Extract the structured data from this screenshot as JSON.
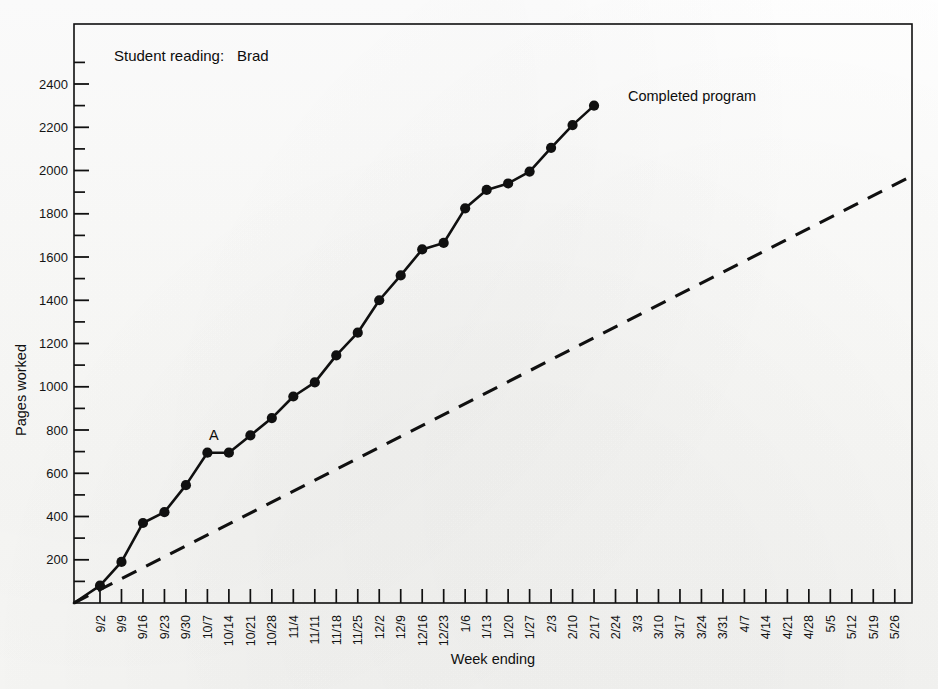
{
  "figure": {
    "background_color": "#fbfbfa",
    "ink_color": "#101010",
    "header_label": "Student reading:",
    "header_value": "Brad",
    "caption": ""
  },
  "annotations": {
    "point_a": "A",
    "completed_program": "Completed program"
  },
  "chart_data": {
    "type": "line",
    "xlabel": "Week ending",
    "ylabel": "Pages worked",
    "xlim": [
      0,
      39
    ],
    "ylim": [
      0,
      2500
    ],
    "ytick_step": 200,
    "yminor_step": 100,
    "grid": false,
    "legend": "none",
    "categories": [
      "9/2",
      "9/9",
      "9/16",
      "9/23",
      "9/30",
      "10/7",
      "10/14",
      "10/21",
      "10/28",
      "11/4",
      "11/11",
      "11/18",
      "11/25",
      "12/2",
      "12/9",
      "12/16",
      "12/23",
      "1/6",
      "1/13",
      "1/20",
      "1/27",
      "2/3",
      "2/10",
      "2/17",
      "2/24",
      "3/3",
      "3/10",
      "3/17",
      "3/24",
      "3/31",
      "4/7",
      "4/14",
      "4/21",
      "4/28",
      "5/5",
      "5/12",
      "5/19",
      "5/26"
    ],
    "ytick_labels": [
      "200",
      "400",
      "600",
      "800",
      "1000",
      "1200",
      "1400",
      "1600",
      "1800",
      "2000",
      "2200",
      "2400"
    ],
    "ytick_values": [
      200,
      400,
      600,
      800,
      1000,
      1200,
      1400,
      1600,
      1800,
      2000,
      2200,
      2400
    ],
    "series": [
      {
        "name": "Pages worked (actual)",
        "style": "solid",
        "marker": "filled-circle",
        "x": [
          "9/2",
          "9/9",
          "9/16",
          "9/23",
          "9/30",
          "10/7",
          "10/14",
          "10/21",
          "10/28",
          "11/4",
          "11/11",
          "11/18",
          "11/25",
          "12/2",
          "12/9",
          "12/16",
          "12/23",
          "1/6",
          "1/13",
          "1/20",
          "1/27",
          "2/3",
          "2/10",
          "2/17"
        ],
        "values": [
          80,
          190,
          370,
          420,
          545,
          695,
          695,
          775,
          855,
          955,
          1020,
          1145,
          1250,
          1400,
          1515,
          1635,
          1665,
          1825,
          1910,
          1940,
          1995,
          2105,
          2210,
          2300
        ]
      },
      {
        "name": "Completed program goal line",
        "style": "dashed",
        "marker": "none",
        "x": [
          "origin",
          "5/26"
        ],
        "values": [
          0,
          1975
        ]
      }
    ],
    "annotations": [
      {
        "text": "A",
        "near_x": "10/7",
        "near_y": 760
      },
      {
        "text": "Completed program",
        "near_x": "2/24",
        "near_y": 2290
      }
    ]
  }
}
